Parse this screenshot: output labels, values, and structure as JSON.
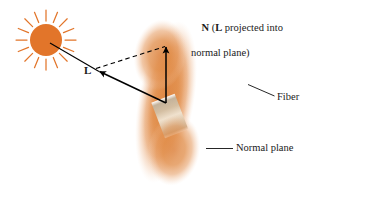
{
  "figure": {
    "background_color": "#ffffff",
    "labels": {
      "n_vector_prefix": "N",
      "n_vector_line1_rest": " (",
      "n_vector_l_symbol": "L",
      "n_vector_line1_tail": " projected into",
      "n_vector_line2": "normal plane)",
      "l_vector": "L",
      "fiber": "Fiber",
      "normal_plane": "Normal plane"
    },
    "colors": {
      "sun_disc": "#E2752A",
      "sun_rays": "#E2752A",
      "normal_plane_orange": "#E08A44",
      "fiber_edge_gray": "#A8AAB0",
      "fiber_highlight": "#FFFFFF",
      "fiber_intersection_band": "#D8C3A8",
      "vector_stroke": "#000000",
      "leader_line": "#1a1a1a",
      "text": "#1a1a1a"
    },
    "elements": {
      "sun": {
        "name": "sun",
        "center_x": 46,
        "center_y": 40,
        "disc_radius": 16,
        "ray_count": 16,
        "ray_inner_radius": 19,
        "ray_outer_radius": 30
      },
      "fiber": {
        "name": "fiber-cylinder",
        "start_x": 10,
        "start_y": 178,
        "end_x": 367,
        "end_y": 40,
        "half_width": 19,
        "fade_ends": true
      },
      "normal_plane": {
        "name": "normal-plane-ellipse",
        "center_x": 166,
        "center_y": 102,
        "radius_x": 28,
        "radius_y": 82,
        "rotation_deg": 10,
        "soft_edges": true
      },
      "l_vector": {
        "name": "l-vector",
        "tail_x": 166,
        "tail_y": 103,
        "tip_x": 96,
        "tip_y": 70,
        "style": "solid",
        "arrowhead": "tip"
      },
      "sun_ray_to_l": {
        "name": "sun-to-l-ray",
        "from_x": 53,
        "from_y": 45,
        "to_x": 96,
        "to_y": 70,
        "style": "solid"
      },
      "n_vector": {
        "name": "n-vector",
        "tail_x": 166,
        "tail_y": 103,
        "tip_x": 166,
        "tip_y": 46,
        "style": "solid",
        "arrowhead": "tip"
      },
      "projection_dashed": {
        "name": "projection-dashed-line",
        "from_x": 96,
        "from_y": 70,
        "to_x": 166,
        "to_y": 46,
        "style": "dashed"
      },
      "fiber_leader": {
        "name": "fiber-leader-line",
        "from_x": 248,
        "from_y": 85,
        "to_x": 274,
        "to_y": 96
      },
      "normal_plane_leader": {
        "name": "normal-plane-leader-line",
        "from_x": 207,
        "from_y": 149,
        "to_x": 233,
        "to_y": 149
      }
    }
  }
}
